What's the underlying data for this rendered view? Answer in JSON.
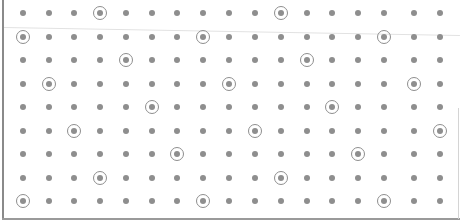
{
  "board": {
    "columns_x": [
      23,
      49,
      74,
      100,
      126,
      152,
      177,
      203,
      229,
      255,
      281,
      307,
      332,
      358,
      384,
      414,
      440
    ],
    "rows_y": [
      13,
      37,
      60,
      84,
      107,
      131,
      154,
      178,
      201
    ],
    "dot_color": "#8e8e8e",
    "circled": [
      [
        3,
        10
      ],
      [
        0,
        7,
        14
      ],
      [
        4,
        11
      ],
      [
        1,
        8,
        15
      ],
      [
        5,
        12
      ],
      [
        2,
        9,
        16
      ],
      [
        6,
        13
      ],
      [
        3,
        10
      ],
      [
        0,
        7,
        14
      ]
    ]
  }
}
